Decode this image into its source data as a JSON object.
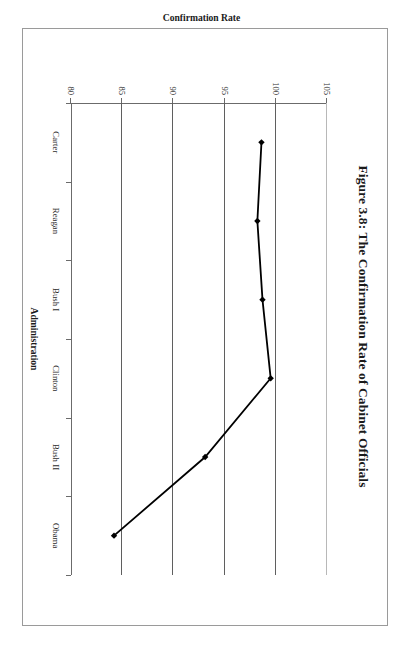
{
  "figure": {
    "title": "Figure 3.8: The Confirmation Rate of Cabinet Officials",
    "rotation_degrees": 90,
    "frame_color": "#9a9a9a"
  },
  "chart_data": {
    "type": "line",
    "title": "Figure 3.8: The Confirmation Rate of Cabinet Officials",
    "xlabel": "Administration",
    "ylabel": "Confirmation Rate",
    "categories": [
      "Carter",
      "Reagan",
      "Bush I",
      "Clinton",
      "Bush II",
      "Obama"
    ],
    "values": [
      98.6,
      98.2,
      98.7,
      99.5,
      93.1,
      84.2
    ],
    "series": [
      {
        "name": "Confirmation Rate",
        "values": [
          98.6,
          98.2,
          98.7,
          99.5,
          93.1,
          84.2
        ]
      }
    ],
    "ylim": [
      80,
      105
    ],
    "yticks": [
      105,
      100,
      95,
      90,
      85,
      80
    ],
    "ytick_labels": [
      "105",
      "100",
      "95",
      "90",
      "85",
      "80"
    ],
    "grid": true,
    "grid_axis": "y",
    "legend": false,
    "marker": "diamond",
    "line_color": "#000000",
    "marker_color": "#000000",
    "gridline_color": "#5f5f5f"
  }
}
